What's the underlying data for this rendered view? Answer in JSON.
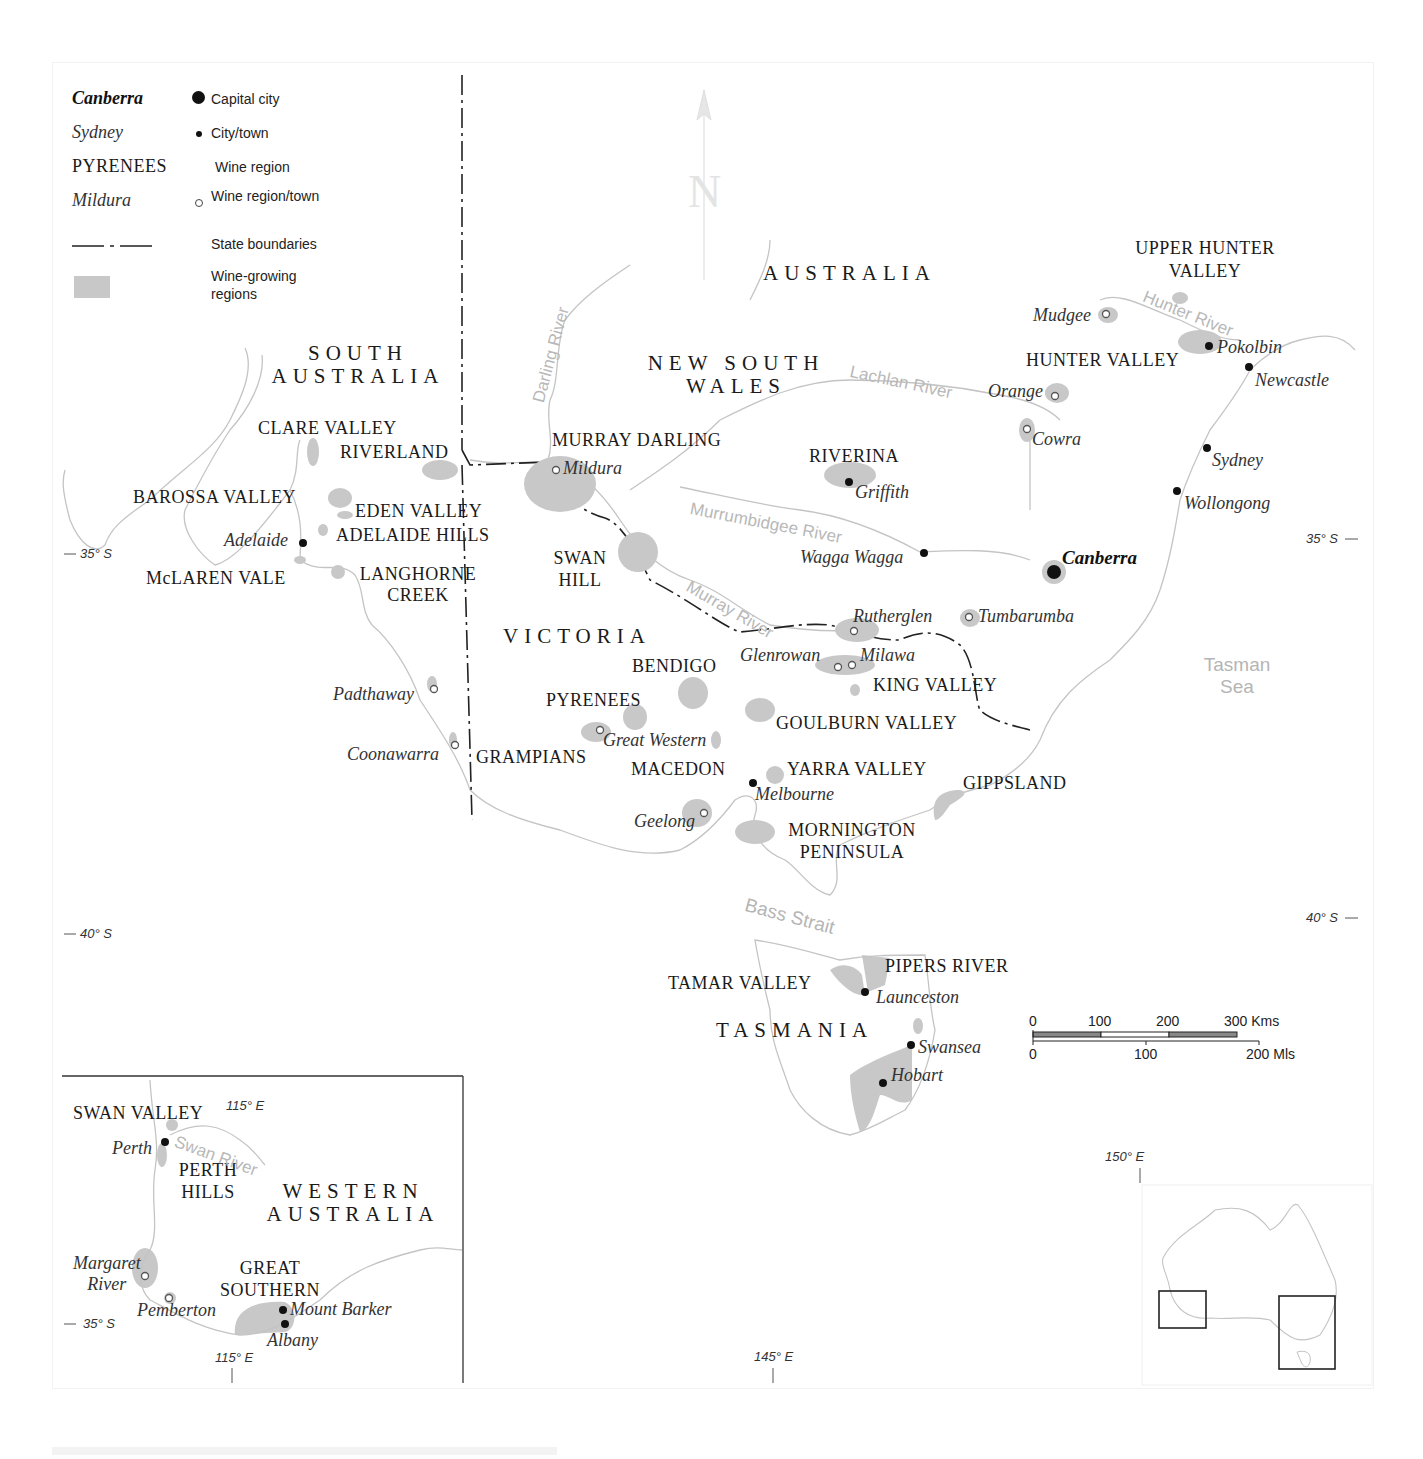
{
  "legend": {
    "items": [
      {
        "sample": "Canberra",
        "description": "Capital city",
        "symbol": "capital-dot"
      },
      {
        "sample": "Sydney",
        "description": "City/town",
        "symbol": "town-dot"
      },
      {
        "sample": "PYRENEES",
        "description": "Wine region",
        "symbol": "none"
      },
      {
        "sample": "Mildura",
        "description": "Wine region/town",
        "symbol": "open-circle"
      },
      {
        "sample": "",
        "description": "State boundaries",
        "symbol": "dash-dot-line"
      },
      {
        "sample": "",
        "description": "Wine-growing regions",
        "symbol": "grey-swatch"
      }
    ]
  },
  "compass": {
    "letter": "N"
  },
  "states": {
    "australia": "AUSTRALIA",
    "south_australia": [
      "SOUTH",
      "AUSTRALIA"
    ],
    "new_south_wales": [
      "NEW SOUTH",
      "WALES"
    ],
    "victoria": "VICTORIA",
    "tasmania": "TASMANIA",
    "western_australia": [
      "WESTERN",
      "AUSTRALIA"
    ]
  },
  "wine_regions": {
    "upper_hunter": [
      "UPPER HUNTER",
      "VALLEY"
    ],
    "hunter_valley": "HUNTER VALLEY",
    "clare_valley": "CLARE VALLEY",
    "riverland": "RIVERLAND",
    "barossa_valley": "BAROSSA VALLEY",
    "eden_valley": "EDEN VALLEY",
    "adelaide_hills": "ADELAIDE HILLS",
    "mclaren_vale": "McLAREN VALE",
    "langhorne_creek": [
      "LANGHORNE",
      "CREEK"
    ],
    "murray_darling": "MURRAY DARLING",
    "riverina": "RIVERINA",
    "swan_hill": [
      "SWAN",
      "HILL"
    ],
    "bendigo": "BENDIGO",
    "pyrenees": "PYRENEES",
    "grampians": "GRAMPIANS",
    "macedon": "MACEDON",
    "king_valley": "KING VALLEY",
    "goulburn_valley": "GOULBURN VALLEY",
    "yarra_valley": "YARRA VALLEY",
    "gippsland": "GIPPSLAND",
    "mornington": [
      "MORNINGTON",
      "PENINSULA"
    ],
    "pipers_river": "PIPERS RIVER",
    "tamar_valley": "TAMAR VALLEY",
    "swan_valley": "SWAN VALLEY",
    "perth_hills": [
      "PERTH",
      "HILLS"
    ],
    "great_southern": [
      "GREAT",
      "SOUTHERN"
    ]
  },
  "towns": {
    "mudgee": "Mudgee",
    "pokolbin": "Pokolbin",
    "newcastle": "Newcastle",
    "orange": "Orange",
    "cowra": "Cowra",
    "sydney": "Sydney",
    "wollongong": "Wollongong",
    "canberra": "Canberra",
    "mildura": "Mildura",
    "griffith": "Griffith",
    "wagga_wagga": "Wagga Wagga",
    "adelaide": "Adelaide",
    "rutherglen": "Rutherglen",
    "tumbarumba": "Tumbarumba",
    "glenrowan": "Glenrowan",
    "milawa": "Milawa",
    "padthaway": "Padthaway",
    "coonawarra": "Coonawarra",
    "great_western": "Great Western",
    "melbourne": "Melbourne",
    "geelong": "Geelong",
    "launceston": "Launceston",
    "swansea": "Swansea",
    "hobart": "Hobart",
    "perth": "Perth",
    "margaret_river": [
      "Margaret",
      "River"
    ],
    "pemberton": "Pemberton",
    "mount_barker": "Mount Barker",
    "albany": "Albany"
  },
  "rivers": {
    "darling": "Darling River",
    "lachlan": "Lachlan River",
    "hunter": "Hunter River",
    "murrumbidgee": "Murrumbidgee River",
    "murray": "Murray River",
    "swan": "Swan River"
  },
  "seas": {
    "tasman": [
      "Tasman",
      "Sea"
    ],
    "bass_strait": "Bass Strait"
  },
  "coordinates": {
    "lat35_left": "35° S",
    "lat35_right": "35° S",
    "lat40_left": "40° S",
    "lat40_right": "40° S",
    "lon150": "150° E",
    "lon145": "145° E",
    "wa_lon115_top": "115° E",
    "wa_lon115_bottom": "115° E",
    "wa_lat35": "35° S"
  },
  "scale_bar": {
    "km_ticks": [
      "0",
      "100",
      "200",
      "300 Kms"
    ],
    "mi_ticks": [
      "0",
      "100",
      "200 Mls"
    ]
  },
  "colors": {
    "wine_region_fill": "#c8c8c8",
    "coastline": "#c4c4c4",
    "river": "#c8c8c8",
    "state_boundary": "#222222",
    "text": "#1a1a1a"
  }
}
